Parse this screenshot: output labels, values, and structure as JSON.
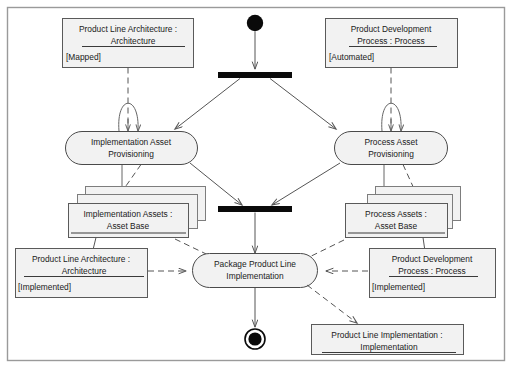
{
  "diagram": {
    "kind": "uml-activity-diagram",
    "frame": {
      "label": ""
    },
    "initial_node": {
      "name": "initial-node"
    },
    "final_node": {
      "name": "final-node"
    },
    "fork_bar": {
      "label": ""
    },
    "join_bar": {
      "label": ""
    },
    "activities": [
      {
        "id": "implementation-asset-provisioning",
        "line1": "Implementation Asset",
        "line2": "Provisioning"
      },
      {
        "id": "process-asset-provisioning",
        "line1": "Process Asset",
        "line2": "Provisioning"
      },
      {
        "id": "package-product-line-implementation",
        "line1": "Package Product Line",
        "line2": "Implementation"
      }
    ],
    "objects": [
      {
        "id": "product-line-architecture-mapped",
        "line1": "Product Line Architecture :",
        "line2": "Architecture",
        "state": "[Mapped]",
        "stacked": false
      },
      {
        "id": "product-development-process-automated",
        "line1": "Product Development",
        "line2": "Process : Process",
        "state": "[Automated]",
        "stacked": false
      },
      {
        "id": "implementation-assets-asset-base",
        "line1": "Implementation Assets :",
        "line2": "Asset Base",
        "state": "",
        "stacked": true
      },
      {
        "id": "process-assets-asset-base",
        "line1": "Process Assets :",
        "line2": "Asset Base",
        "state": "",
        "stacked": true
      },
      {
        "id": "product-line-architecture-implemented",
        "line1": "Product Line Architecture :",
        "line2": "Architecture",
        "state": "[Implemented]",
        "stacked": false
      },
      {
        "id": "product-development-process-implemented",
        "line1": "Product Development",
        "line2": "Process : Process",
        "state": "[Implemented]",
        "stacked": false
      },
      {
        "id": "product-line-implementation-implementation",
        "line1": "Product Line Implementation :",
        "line2": "Implementation",
        "state": "",
        "stacked": false
      }
    ],
    "colors": {
      "node_fill": "#f2f2f2",
      "node_stroke": "#5a5a5a",
      "bar_fill": "#0a0a0a",
      "frame_stroke": "#9a9a9a",
      "flow_stroke": "#555555",
      "text": "#1a1a1a",
      "background": "#ffffff"
    }
  }
}
